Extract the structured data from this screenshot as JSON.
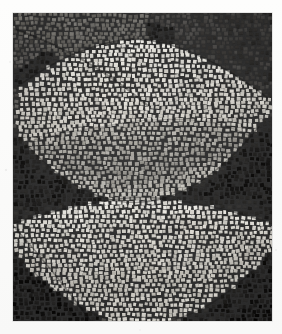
{
  "document": {
    "kind": "photograph",
    "subject": "ancient stone mosaic pavement",
    "medium": "tesserae mosaic",
    "palette_mode": "grayscale",
    "alt_text": "Black and white photograph of a Roman mosaic made of small square tesserae, showing two large pale bowl- or vessel-shaped forms, one above the other, set against darker grey and near-black tile fields."
  },
  "canvas": {
    "width": 282,
    "height": 334,
    "background_color": "#fbfbfa",
    "margin_color": "#fdfdfc"
  },
  "plate": {
    "left": 13,
    "top": 13,
    "width": 259,
    "height": 308,
    "border_color": "#8c8c8c"
  },
  "tesserae": {
    "nominal_size_px": 4.6,
    "grout_color": "#2b2b2b",
    "grout_width_px": 0.9,
    "jitter_px": 0.9,
    "row_wave_amplitude_px": 1.4
  },
  "tones": {
    "highlight": "#e8e6e0",
    "light": "#cfccc4",
    "light_mid": "#b4b1a9",
    "mid": "#8e8c86",
    "mid_dark": "#6a6863",
    "dark": "#494745",
    "very_dark": "#2e2d2b",
    "near_black": "#151413"
  },
  "regions": [
    {
      "name": "upper-left-field",
      "role": "background",
      "tone": "mid_dark",
      "description": "sweeping band of mid-dark tesserae curving down from the upper left corner"
    },
    {
      "name": "upper-right-field",
      "role": "background",
      "tone": "dark",
      "description": "dark tile field occupying the upper right corner above the first bowl"
    },
    {
      "name": "upper-bowl",
      "role": "motif",
      "tone": "light",
      "description": "large pale bowl shape with flaring rim, filling the upper two thirds of the panel"
    },
    {
      "name": "upper-bowl-interior-shadow",
      "role": "motif-shading",
      "tone": "mid",
      "description": "grey band of tesserae describing the shadowed interior of the upper bowl"
    },
    {
      "name": "middle-dark-band",
      "role": "background",
      "tone": "near_black",
      "description": "near-black wedge of tesserae separating the two bowls"
    },
    {
      "name": "lower-bowl",
      "role": "motif",
      "tone": "highlight",
      "description": "second pale bowl shape, wider and brighter, in the lower half of the panel"
    },
    {
      "name": "lower-bowl-interior-shadow",
      "role": "motif-shading",
      "tone": "light_mid",
      "description": "soft grey shading inside the rim of the lower bowl"
    },
    {
      "name": "lower-left-field",
      "role": "background",
      "tone": "near_black",
      "description": "near-black triangular tile field in the lower left corner"
    },
    {
      "name": "lower-right-field",
      "role": "background",
      "tone": "very_dark",
      "description": "very dark tile field wrapping the lower right corner"
    },
    {
      "name": "bottom-edge-field",
      "role": "background",
      "tone": "mid_dark",
      "description": "band of mid-dark tesserae along the bottom edge of the panel"
    }
  ]
}
